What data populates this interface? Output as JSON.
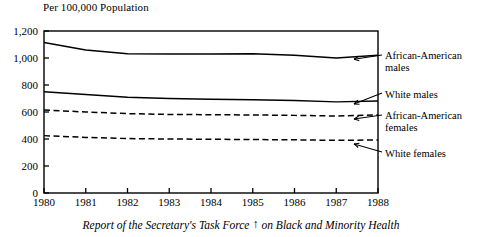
{
  "chart_data": {
    "type": "line",
    "title": "Per 100,000 Population",
    "xlabel": "",
    "ylabel": "Per 100,000 Population",
    "xlim": [
      1980,
      1988
    ],
    "ylim": [
      0,
      1200
    ],
    "grid": false,
    "legend_position": "right-outside-with-leader-lines",
    "x": [
      1980,
      1981,
      1982,
      1983,
      1984,
      1985,
      1986,
      1987,
      1988
    ],
    "categories": [
      "1980",
      "1981",
      "1982",
      "1983",
      "1984",
      "1985",
      "1986",
      "1987",
      "1988"
    ],
    "y_ticks": [
      0,
      200,
      400,
      600,
      800,
      1000,
      1200
    ],
    "y_tick_labels": [
      "0",
      "200",
      "400",
      "600",
      "800",
      "1,000",
      "1,200"
    ],
    "series": [
      {
        "name": "African-American males",
        "style": "solid",
        "color": "#000000",
        "values": [
          1115,
          1060,
          1032,
          1030,
          1030,
          1032,
          1020,
          1000,
          1020
        ]
      },
      {
        "name": "White males",
        "style": "solid",
        "color": "#000000",
        "values": [
          750,
          730,
          710,
          700,
          695,
          690,
          685,
          675,
          682
        ]
      },
      {
        "name": "African-American females",
        "style": "dashed",
        "color": "#000000",
        "values": [
          615,
          600,
          588,
          582,
          580,
          578,
          575,
          570,
          578
        ]
      },
      {
        "name": "White females",
        "style": "dashed",
        "color": "#000000",
        "values": [
          425,
          412,
          403,
          400,
          398,
          396,
          394,
          390,
          393
        ]
      }
    ]
  },
  "labels": {
    "series_1_line_1": "African-American",
    "series_1_line_2": "males",
    "series_2_line_1": "White males",
    "series_3_line_1": "African-American",
    "series_3_line_2": "females",
    "series_4_line_1": "White females"
  },
  "footer": {
    "text_before": "Report of the Secretary's Task Force",
    "arrow_glyph": "↑",
    "text_after": "on Black and Minority Health"
  }
}
